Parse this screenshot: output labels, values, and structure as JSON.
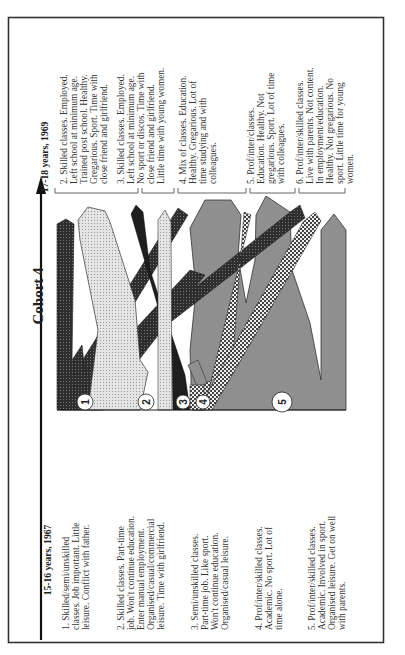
{
  "figure": {
    "title": "Cohort 4",
    "start_stage": {
      "heading": "15-16 years, 1967",
      "groups": [
        {
          "id": "1",
          "lines": [
            "1. Skilled/semi/unskilled",
            "classes. Job important. Little",
            "leisure. Conflict with father."
          ]
        },
        {
          "id": "2",
          "lines": [
            "2. Skilled classes. Part-time",
            "job. Won't continue education.",
            "Enter manual employment.",
            "Organised/casual/commercial",
            "leisure. Time with girlfriend."
          ]
        },
        {
          "id": "3",
          "lines": [
            "3. Semi/unskilled classes.",
            "Part-time job. Like sport.",
            "Won't continue education.",
            "Organised/casual leisure."
          ]
        },
        {
          "id": "4",
          "lines": [
            "4. Prof/inter/skilled classes.",
            "Academic. No sport. Lot of",
            "time alone."
          ]
        },
        {
          "id": "5",
          "lines": [
            "5. Prof/inter/skilled classes.",
            "Academic. Involved in sport.",
            "Organised leisure. Get on well",
            "with parents."
          ]
        }
      ]
    },
    "end_stage": {
      "heading": "17-18 years, 1969",
      "groups": [
        {
          "id": "2",
          "lines": [
            "2. Skilled classes. Employed.",
            "Left school at minimum age.",
            "Trained post school. Healthy.",
            "Gregarious. Sport. Time with",
            "close friend and girlfriend."
          ]
        },
        {
          "id": "3",
          "lines": [
            "3. Skilled classes. Employed.",
            "Left school at minimum age.",
            "No sport or discos. Time with",
            "close friend and girlfriend.",
            "Little time with young women."
          ]
        },
        {
          "id": "4",
          "lines": [
            "4. Mix of classes. Education.",
            "Healthy. Gregarious. Lot of",
            "time studying and with",
            "colleagues."
          ]
        },
        {
          "id": "5",
          "lines": [
            "5. Prof/inter/classes.",
            "Education. Healthy. Not",
            "gregarious. Sport. Lot of time",
            "with colleagues."
          ]
        },
        {
          "id": "6",
          "lines": [
            "6. Prof/inter/skilled classes.",
            "Live with parents. Not content.",
            "In employment/education.",
            "Healthy. Not gregarious. No",
            "sport. Little time for young",
            "women."
          ]
        }
      ]
    },
    "markers": [
      "1",
      "2",
      "3",
      "4",
      "5"
    ],
    "colors": {
      "frame": "#333333",
      "group1": "#3a3a3a",
      "group2": "#d9d9d9",
      "group3": "#1e1e1e",
      "group4": "#c8c8c8",
      "group5": "#8f8f8f",
      "background": "#ffffff"
    }
  }
}
